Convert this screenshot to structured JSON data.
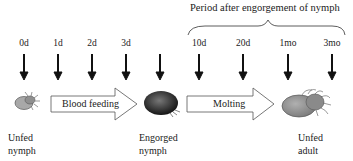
{
  "header": {
    "period_title": "Period after engorgement of nymph"
  },
  "timepoints": [
    {
      "label": "0d",
      "x": 24
    },
    {
      "label": "1d",
      "x": 58
    },
    {
      "label": "2d",
      "x": 92
    },
    {
      "label": "3d",
      "x": 126
    },
    {
      "label": "",
      "x": 160
    },
    {
      "label": "10d",
      "x": 199
    },
    {
      "label": "20d",
      "x": 243
    },
    {
      "label": "1mo",
      "x": 288
    },
    {
      "label": "3mo",
      "x": 332
    }
  ],
  "stages": [
    {
      "line1": "Unfed",
      "line2": "nymph"
    },
    {
      "line1": "Engorged",
      "line2": "nymph"
    },
    {
      "line1": "Unfed",
      "line2": "adult"
    }
  ],
  "processes": [
    {
      "label": "Blood feeding"
    },
    {
      "label": "Molting"
    }
  ],
  "colors": {
    "ink": "#111111",
    "tick_body": "#9a9a9a",
    "engorged": "#2a2a2a"
  }
}
